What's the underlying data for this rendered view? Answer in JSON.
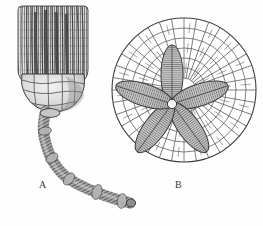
{
  "plate": {
    "title": "Crinoid fossil plate",
    "background_color": "#fefefe",
    "ink_color": "#3a3a3a",
    "width": 263,
    "height": 226,
    "style": "engraving"
  },
  "figures": [
    {
      "key": "A",
      "label": "A",
      "name": "crinoid-lateral-view",
      "description": "Complete crinoid in lateral view: ribbed arm crown above, bulbous calyx cup, long segmented curving stem",
      "label_x": 39,
      "label_y": 180,
      "parts": [
        {
          "name": "arm-crown",
          "arm_count": 13
        },
        {
          "name": "calyx-cup"
        },
        {
          "name": "columnal-stem",
          "segment_count": 58
        }
      ]
    },
    {
      "key": "B",
      "label": "B",
      "name": "crinoid-oral-disk-view",
      "description": "Oral disk view: five petaloid ambulacra radiating from central mouth, surrounded by concentric rings of polygonal interambulacral plates",
      "label_x": 175,
      "label_y": 180,
      "center_x": 184,
      "center_y": 90,
      "outer_radius": 72,
      "petal_count": 5,
      "petal_center_x": 172,
      "petal_center_y": 104,
      "petal_angles_deg": [
        -90,
        -18,
        54,
        126,
        198
      ],
      "ring_count": 6,
      "parts": [
        {
          "name": "ambulacral-petal"
        },
        {
          "name": "interambulacral-plate-mosaic"
        },
        {
          "name": "central-mouth"
        }
      ]
    }
  ],
  "colors": {
    "ink": "#3a3a3a",
    "line": "#4a4a4a",
    "shade_light": "#dadada",
    "shade_mid": "#9a9a9a",
    "shade_dark": "#5d5d5d",
    "paper": "#fefefe"
  }
}
